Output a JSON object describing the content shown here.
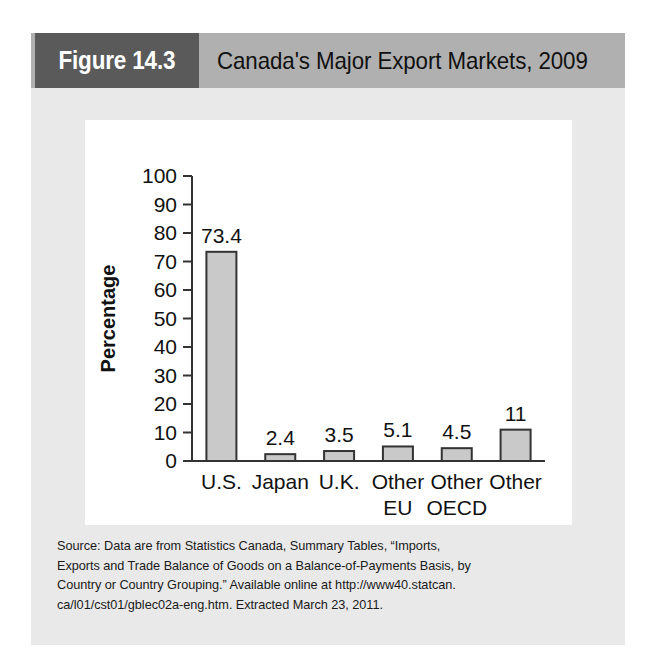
{
  "figure": {
    "tag_label": "Figure 14.3",
    "title": "Canada's Major Export Markets, 2009",
    "header_bg": "#b0b0b0",
    "tag_bg": "#5a5a5a",
    "panel_bg": "#e9e9e9"
  },
  "chart_data": {
    "type": "bar",
    "title": "Canada's Major Export Markets, 2009",
    "categories": [
      "U.S.",
      "Japan",
      "U.K.",
      "Other EU",
      "Other OECD",
      "Other"
    ],
    "category_lines": [
      [
        "U.S."
      ],
      [
        "Japan"
      ],
      [
        "U.K."
      ],
      [
        "Other",
        "EU"
      ],
      [
        "Other",
        "OECD"
      ],
      [
        "Other"
      ]
    ],
    "values": [
      73.4,
      2.4,
      3.5,
      5.1,
      4.5,
      11
    ],
    "value_labels": [
      "73.4",
      "2.4",
      "3.5",
      "5.1",
      "4.5",
      "11"
    ],
    "xlabel": "Country",
    "ylabel": "Percentage",
    "ylim": [
      0,
      100
    ],
    "yticks": [
      0,
      10,
      20,
      30,
      40,
      50,
      60,
      70,
      80,
      90,
      100
    ],
    "ytick_labels": [
      "0",
      "10",
      "20",
      "30",
      "40",
      "50",
      "60",
      "70",
      "80",
      "90",
      "100"
    ],
    "grid": false,
    "legend": false,
    "bar_fill": "#c9c9c9",
    "bar_stroke": "#333333",
    "axis_color": "#333333"
  },
  "source": {
    "lines": [
      "Source: Data are from Statistics Canada, Summary Tables, “Imports,",
      "Exports and Trade Balance of Goods on a Balance-of-Payments Basis, by",
      "Country or Country Grouping.” Available online at http://www40.statcan.",
      "ca/l01/cst01/gblec02a-eng.htm. Extracted March 23, 2011."
    ]
  }
}
